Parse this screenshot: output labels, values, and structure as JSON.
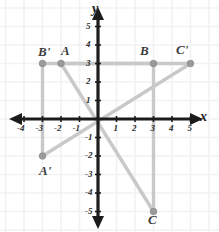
{
  "figure": {
    "axis_labels": {
      "x": "x",
      "y": "y"
    },
    "colors": {
      "axis": "#1c1c1c",
      "grid": "#f2f2f4",
      "shape": "#c9c9c9",
      "point": "#9a9a9a",
      "label": "#3c3c3c"
    }
  },
  "chart_data": {
    "type": "scatter",
    "title": "",
    "xlabel": "x",
    "ylabel": "y",
    "xlim": [
      -4.8,
      5.9
    ],
    "ylim": [
      -6.0,
      5.9
    ],
    "grid": true,
    "legend": "none",
    "xticks": [
      -4,
      -3,
      -2,
      -1,
      1,
      2,
      3,
      4,
      5
    ],
    "xtick_labels": [
      "-4",
      "-3",
      "-2",
      "-1",
      "1",
      "2",
      "3",
      "4",
      "5"
    ],
    "yticks": [
      5,
      4,
      3,
      2,
      1,
      -1,
      -2,
      -3,
      -4,
      -5
    ],
    "ytick_labels": [
      "5",
      "4",
      "3",
      "2",
      "1",
      "-1",
      "-2",
      "-3",
      "-4",
      "-5"
    ],
    "series": [
      {
        "name": "Triangle ABC",
        "closed": true,
        "points": [
          {
            "label": "A",
            "x": -2,
            "y": 3
          },
          {
            "label": "B",
            "x": 3,
            "y": 3
          },
          {
            "label": "C",
            "x": 3,
            "y": -5
          }
        ]
      },
      {
        "name": "Triangle A'B'C'",
        "closed": true,
        "points": [
          {
            "label": "A'",
            "x": -3,
            "y": -2
          },
          {
            "label": "B'",
            "x": -3,
            "y": 3
          },
          {
            "label": "C'",
            "x": 5,
            "y": 3
          }
        ]
      }
    ]
  },
  "point_labels": [
    {
      "text": "B'",
      "x": 38,
      "y": 45
    },
    {
      "text": "A",
      "x": 61,
      "y": 44
    },
    {
      "text": "B",
      "x": 140,
      "y": 44
    },
    {
      "text": "C'",
      "x": 176,
      "y": 43
    },
    {
      "text": "A'",
      "x": 39,
      "y": 164
    },
    {
      "text": "C",
      "x": 148,
      "y": 213
    }
  ],
  "x_tick_labels": [
    {
      "text": "-4",
      "value": -4
    },
    {
      "text": "-3",
      "value": -3
    },
    {
      "text": "-2",
      "value": -2
    },
    {
      "text": "-1",
      "value": -1
    },
    {
      "text": "1",
      "value": 1
    },
    {
      "text": "2",
      "value": 2
    },
    {
      "text": "3",
      "value": 3
    },
    {
      "text": "4",
      "value": 4
    },
    {
      "text": "5",
      "value": 5
    }
  ],
  "y_tick_labels": [
    {
      "text": "5",
      "value": 5
    },
    {
      "text": "4",
      "value": 4
    },
    {
      "text": "3",
      "value": 3
    },
    {
      "text": "2",
      "value": 2
    },
    {
      "text": "1",
      "value": 1
    },
    {
      "text": "-1",
      "value": -1
    },
    {
      "text": "-2",
      "value": -2
    },
    {
      "text": "-3",
      "value": -3
    },
    {
      "text": "-4",
      "value": -4
    },
    {
      "text": "-5",
      "value": -5
    }
  ]
}
